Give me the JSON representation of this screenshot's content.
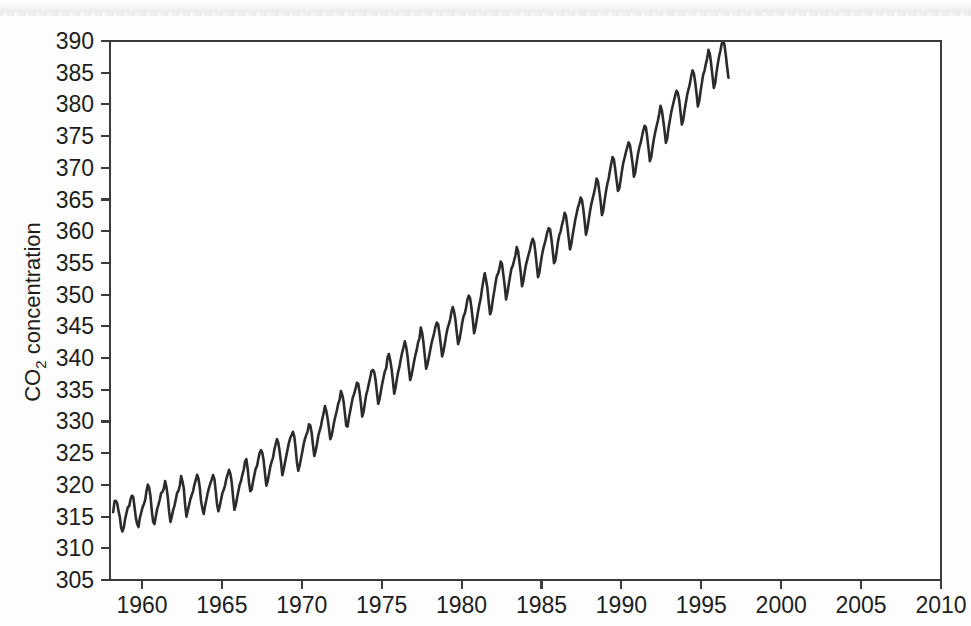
{
  "figure": {
    "background_color": "#fdfdfd",
    "plot_frame_color": "#3b3b3b",
    "line_color": "#2b2b2b"
  },
  "axes": {
    "y_title_main": "CO",
    "y_title_sub": "2",
    "y_title_rest": " concentration",
    "y_ticks": [
      "305",
      "310",
      "315",
      "320",
      "325",
      "330",
      "335",
      "340",
      "345",
      "350",
      "355",
      "360",
      "365",
      "370",
      "375",
      "380",
      "385",
      "390"
    ],
    "x_ticks": [
      "1960",
      "1965",
      "1970",
      "1975",
      "1980",
      "1985",
      "1990",
      "1995",
      "2000",
      "2005",
      "2010"
    ]
  },
  "chart_data": {
    "type": "line",
    "title": "",
    "xlabel": "",
    "ylabel": "CO2 concentration",
    "xlim": [
      1958.0,
      2010.0
    ],
    "ylim": [
      305,
      390
    ],
    "grid": false,
    "legend": null,
    "series": [
      {
        "name": "Mauna Loa monthly mean CO2 concentration",
        "x_start": 1958.2,
        "x_step": 0.0833333,
        "units": "ppm",
        "annual_means": {
          "1958": 315.3,
          "1959": 315.98,
          "1960": 316.91,
          "1961": 317.64,
          "1962": 318.45,
          "1963": 318.99,
          "1964": 319.62,
          "1965": 320.04,
          "1966": 321.38,
          "1967": 322.16,
          "1968": 323.04,
          "1969": 324.62,
          "1970": 325.68,
          "1971": 326.32,
          "1972": 327.45,
          "1973": 329.68,
          "1974": 330.18,
          "1975": 331.11,
          "1976": 332.04,
          "1977": 333.83,
          "1978": 335.4,
          "1979": 336.84,
          "1980": 338.75,
          "1981": 340.11,
          "1982": 341.45,
          "1983": 343.05,
          "1984": 344.65,
          "1985": 346.12,
          "1986": 347.42,
          "1987": 349.19,
          "1988": 351.57,
          "1989": 353.12,
          "1990": 354.39,
          "1991": 355.61,
          "1992": 356.45,
          "1993": 357.1,
          "1994": 358.83,
          "1995": 360.82,
          "1996": 362.61,
          "1997": 363.73,
          "1998": 366.7,
          "1999": 368.38,
          "2000": 369.55,
          "2001": 371.14,
          "2002": 373.28,
          "2003": 375.8,
          "2004": 377.52,
          "2005": 379.8,
          "2006": 381.9,
          "2007": 383.79,
          "2008": 385.6
        },
        "seasonal_amplitude_ppm": 6.2,
        "seasonal_peak_month": 5,
        "values": [
          315.71,
          317.45,
          317.5,
          317.1,
          315.86,
          314.93,
          313.2,
          312.66,
          313.33,
          314.67,
          315.58,
          316.47,
          316.65,
          317.71,
          318.29,
          318.16,
          316.55,
          314.8,
          313.84,
          313.34,
          314.81,
          315.59,
          316.43,
          316.97,
          317.58,
          319.02,
          320.03,
          319.59,
          318.18,
          315.91,
          314.16,
          313.83,
          315.0,
          316.19,
          316.89,
          317.7,
          318.71,
          318.87,
          319.42,
          320.62,
          319.61,
          318.06,
          315.74,
          314.16,
          315.0,
          316.02,
          316.69,
          317.69,
          318.74,
          319.08,
          319.86,
          321.39,
          320.56,
          319.48,
          316.85,
          314.98,
          315.94,
          316.85,
          317.78,
          318.4,
          319.02,
          320.03,
          320.74,
          321.6,
          321.01,
          319.61,
          317.4,
          316.26,
          315.42,
          316.69,
          317.69,
          318.74,
          319.57,
          320.24,
          320.86,
          321.55,
          320.91,
          319.0,
          316.89,
          315.84,
          316.65,
          317.7,
          318.7,
          319.23,
          319.94,
          320.95,
          321.68,
          322.38,
          321.75,
          320.38,
          318.15,
          316.07,
          316.78,
          317.94,
          319.01,
          320.06,
          320.62,
          321.59,
          322.39,
          323.7,
          324.07,
          322.51,
          320.34,
          318.99,
          319.29,
          320.53,
          321.54,
          322.57,
          322.97,
          324.08,
          325.05,
          325.48,
          325.05,
          323.8,
          321.77,
          319.88,
          320.56,
          321.72,
          322.91,
          323.67,
          324.27,
          325.53,
          326.4,
          327.21,
          326.6,
          325.22,
          323.62,
          321.53,
          322.4,
          323.54,
          324.61,
          325.64,
          326.68,
          327.42,
          327.86,
          328.38,
          327.62,
          325.77,
          323.49,
          322.24,
          323.06,
          324.11,
          325.23,
          326.38,
          327.25,
          327.89,
          328.44,
          329.57,
          329.37,
          328.26,
          326.31,
          324.55,
          325.3,
          326.44,
          327.71,
          328.53,
          329.28,
          330.37,
          331.33,
          332.43,
          331.69,
          330.48,
          328.96,
          327.21,
          327.75,
          328.87,
          330.04,
          330.95,
          331.77,
          332.82,
          333.4,
          334.8,
          334.2,
          333.14,
          331.27,
          329.3,
          329.2,
          330.57,
          331.67,
          332.82,
          333.82,
          334.39,
          335.18,
          336.12,
          335.95,
          334.65,
          332.86,
          330.78,
          331.52,
          332.9,
          334.23,
          335.0,
          335.99,
          336.93,
          337.95,
          338.13,
          337.78,
          336.54,
          334.68,
          332.76,
          333.48,
          334.77,
          335.96,
          336.95,
          337.93,
          338.39,
          340.08,
          340.63,
          339.65,
          338.37,
          336.48,
          334.39,
          335.3,
          336.68,
          337.83,
          338.69,
          339.84,
          340.88,
          341.71,
          342.65,
          341.77,
          340.33,
          338.39,
          336.53,
          337.25,
          338.4,
          339.53,
          340.55,
          341.37,
          342.52,
          343.11,
          344.82,
          343.95,
          342.39,
          340.3,
          338.34,
          339.04,
          340.08,
          341.19,
          342.31,
          343.13,
          343.96,
          344.94,
          345.59,
          345.33,
          343.83,
          342.15,
          340.25,
          341.06,
          342.24,
          343.54,
          344.61,
          345.3,
          346.07,
          347.28,
          348.04,
          347.25,
          346.0,
          344.0,
          342.19,
          342.9,
          344.12,
          345.45,
          346.56,
          347.0,
          347.96,
          349.23,
          349.84,
          349.42,
          347.97,
          346.05,
          343.93,
          344.78,
          346.1,
          347.37,
          348.48,
          349.42,
          350.99,
          352.23,
          353.37,
          352.3,
          351.0,
          348.8,
          346.9,
          347.57,
          349.1,
          350.36,
          351.7,
          352.91,
          353.32,
          354.1,
          355.22,
          354.81,
          353.09,
          351.39,
          349.25,
          350.25,
          351.62,
          352.85,
          354.09,
          354.53,
          355.34,
          356.18,
          357.49,
          356.91,
          355.25,
          353.5,
          351.33,
          352.17,
          353.55,
          354.74,
          355.56,
          356.37,
          357.15,
          358.15,
          358.81,
          358.34,
          356.78,
          354.79,
          352.78,
          353.46,
          354.98,
          356.24,
          357.31,
          358.03,
          358.91,
          359.87,
          360.49,
          360.31,
          358.89,
          357.0,
          354.98,
          355.34,
          356.8,
          358.36,
          359.4,
          359.98,
          361.01,
          361.84,
          362.92,
          362.43,
          360.8,
          359.01,
          357.14,
          357.97,
          359.41,
          360.59,
          361.86,
          362.79,
          363.78,
          364.39,
          365.31,
          364.92,
          363.49,
          361.59,
          359.46,
          360.34,
          361.74,
          363.1,
          364.24,
          365.14,
          365.97,
          367.03,
          368.31,
          367.87,
          366.32,
          364.72,
          362.55,
          363.3,
          364.87,
          366.25,
          367.41,
          368.28,
          369.54,
          370.67,
          371.69,
          371.29,
          369.73,
          368.08,
          366.36,
          366.7,
          368.08,
          369.48,
          370.75,
          371.58,
          372.47,
          373.23,
          374.01,
          373.61,
          372.22,
          370.69,
          368.6,
          369.26,
          370.78,
          372.12,
          373.17,
          373.89,
          374.87,
          375.85,
          376.64,
          376.4,
          374.83,
          373.02,
          371.05,
          371.69,
          373.21,
          374.54,
          375.6,
          376.57,
          377.42,
          378.5,
          379.78,
          379.05,
          377.55,
          375.86,
          373.94,
          374.62,
          376.27,
          377.48,
          378.73,
          379.64,
          380.54,
          381.39,
          382.16,
          381.82,
          380.7,
          378.8,
          376.83,
          377.48,
          379.0,
          380.23,
          381.53,
          382.37,
          383.2,
          384.45,
          385.36,
          384.92,
          383.57,
          381.79,
          379.68,
          380.42,
          382.0,
          383.32,
          384.68,
          385.3,
          386.36,
          387.22,
          388.6,
          388.0,
          386.4,
          384.5,
          382.6,
          383.3,
          385.0,
          386.4,
          387.6,
          388.5,
          389.6,
          390.1,
          389.4,
          387.8,
          385.9,
          384.2
        ]
      }
    ]
  }
}
